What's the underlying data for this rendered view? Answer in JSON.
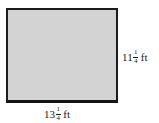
{
  "figure": {
    "shape": "rectangle",
    "fill_color": "#d3d3d3",
    "stroke_color": "#1c1c1c",
    "width_label": {
      "whole": "13",
      "numerator": "1",
      "denominator": "4",
      "unit": "ft"
    },
    "height_label": {
      "whole": "11",
      "numerator": "1",
      "denominator": "4",
      "unit": "ft"
    }
  }
}
